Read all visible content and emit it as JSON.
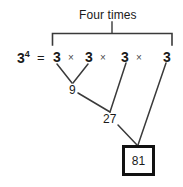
{
  "diagram": {
    "caption": "Four times",
    "expression": {
      "base": "3",
      "exponent": "4",
      "equals": "=",
      "factors": [
        "3",
        "3",
        "3",
        "3"
      ],
      "operator": "×"
    },
    "intermediate_results": [
      {
        "label": "9"
      },
      {
        "label": "27"
      }
    ],
    "final_result": "81",
    "colors": {
      "ink": "#1a1a1a",
      "box_border": "#111111",
      "line": "#3a3a3a",
      "background": "#ffffff"
    }
  }
}
